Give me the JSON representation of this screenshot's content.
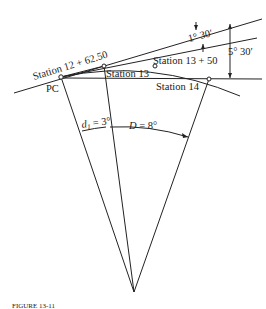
{
  "diagram": {
    "labels": {
      "station_pc": "Station 12 + 62.50",
      "pc": "PC",
      "station_13": "Station 13",
      "station_13_50": "Station 13 + 50",
      "station_14": "Station 14",
      "deflection_small": "1° 30′",
      "deflection_large": "5° 30′",
      "d1": "d",
      "d1_sub": "1",
      "d1_value": " = 3°",
      "D": "D",
      "D_value": " = 8°"
    },
    "caption": "FIGURE 13-11"
  }
}
